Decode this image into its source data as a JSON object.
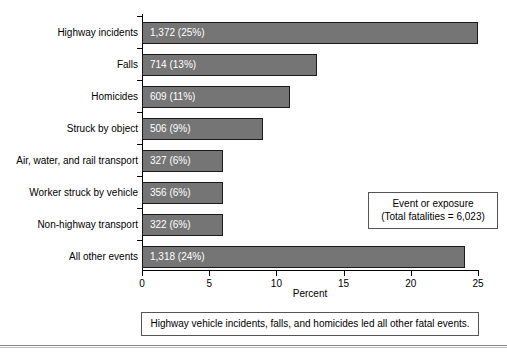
{
  "chart_data": {
    "type": "bar",
    "orientation": "horizontal",
    "title": "",
    "xlabel": "Percent",
    "ylabel": "",
    "xlim": [
      0,
      25
    ],
    "xticks": [
      0,
      5,
      10,
      15,
      20,
      25
    ],
    "xtick_labels": [
      "0",
      "5",
      "10",
      "15",
      "20",
      "25"
    ],
    "grid": false,
    "legend_position": "inside-right",
    "bar_color": "#757575",
    "bar_edge_color": "#1a1a1a",
    "bar_label_color": "#ffffff",
    "categories": [
      "Highway incidents",
      "Falls",
      "Homicides",
      "Struck by object",
      "Air, water, and rail transport",
      "Worker struck by vehicle",
      "Non-highway transport",
      "All other events"
    ],
    "values": [
      25,
      13,
      11,
      9,
      6,
      6,
      6,
      24
    ],
    "counts": [
      1372,
      714,
      609,
      506,
      327,
      356,
      322,
      1318
    ],
    "data_labels": [
      "1,372 (25%)",
      "714 (13%)",
      "609 (11%)",
      "506 (9%)",
      "327 (6%)",
      "356 (6%)",
      "322 (6%)",
      "1,318 (24%)"
    ],
    "annotations": [
      "Event or exposure",
      "(Total fatalities = 6,023)",
      "Highway vehicle incidents, falls, and homicides led all other fatal events."
    ]
  },
  "legend": {
    "line1": "Event or exposure",
    "line2": "(Total fatalities = 6,023)"
  },
  "caption": {
    "text": "Highway vehicle incidents, falls, and homicides led all other fatal events."
  },
  "axis": {
    "x_title": "Percent"
  },
  "footer": {
    "remnant": ""
  }
}
